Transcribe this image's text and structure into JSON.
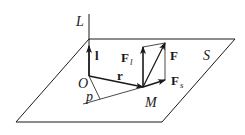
{
  "diagram": {
    "type": "vector-geometry",
    "colors": {
      "stroke": "#1a1a1a",
      "background": "#ffffff"
    },
    "labels": {
      "axis": "L",
      "plane": "S",
      "origin": "O",
      "unit_vector": "l",
      "radius_vector": "r",
      "distance": "p",
      "point": "M",
      "force": "F",
      "force_parallel_base": "F",
      "force_parallel_sub": "l",
      "force_plane_base": "F",
      "force_plane_sub": "s"
    },
    "nodes": [
      {
        "id": "O",
        "label": "O"
      },
      {
        "id": "M",
        "label": "M"
      }
    ],
    "edges": [
      {
        "from": "O",
        "to": "l-tip",
        "label": "l",
        "arrow": true
      },
      {
        "from": "O",
        "to": "M",
        "label": "r",
        "arrow": true
      },
      {
        "from": "M",
        "to": "F_l-tip",
        "label": "F_l",
        "arrow": true
      },
      {
        "from": "M",
        "to": "F-tip",
        "label": "F",
        "arrow": true
      },
      {
        "from": "M",
        "to": "F_s-tip",
        "label": "F_s",
        "arrow": true
      },
      {
        "from": "O",
        "to": "foot",
        "label": "p",
        "arrow": false
      }
    ]
  }
}
